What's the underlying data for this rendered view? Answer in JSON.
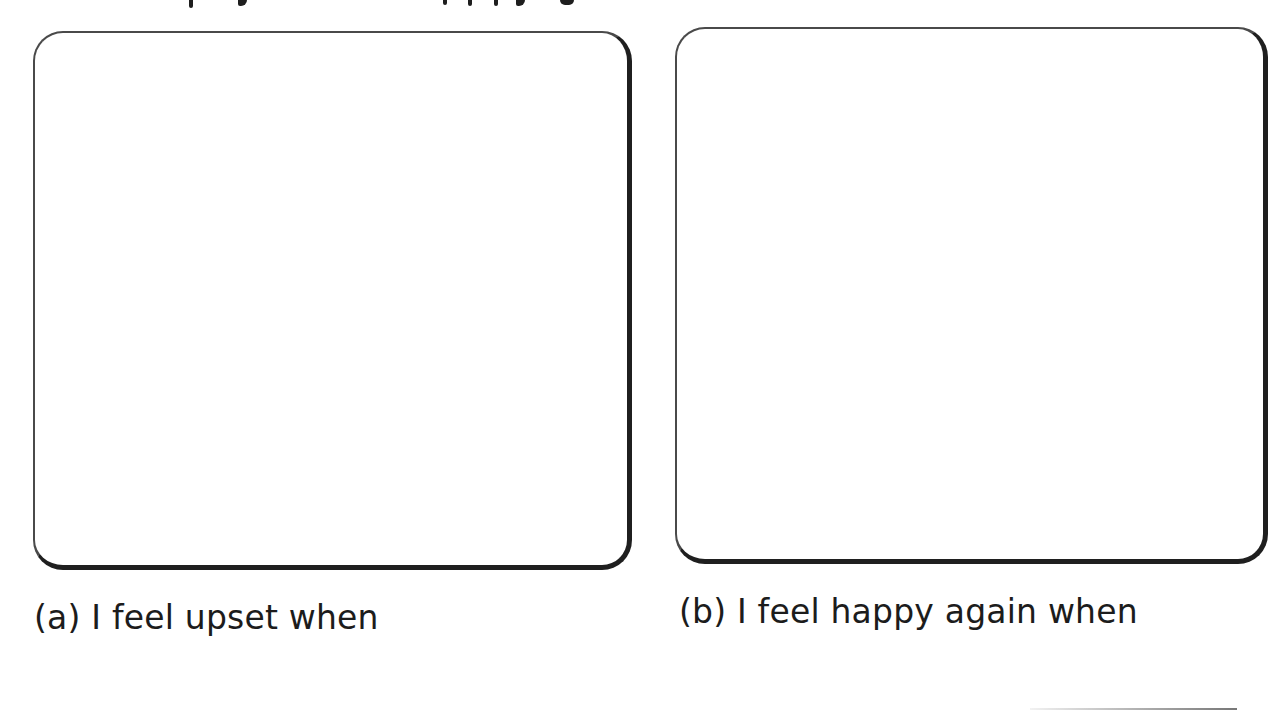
{
  "page": {
    "top_text_cropped": true
  },
  "panels": [
    {
      "id": "a",
      "prompt": "(a) I feel upset when",
      "drawing_area": "empty"
    },
    {
      "id": "b",
      "prompt": "(b) I feel happy again when",
      "drawing_area": "empty"
    }
  ],
  "colors": {
    "frame_border": "#1f1f1f",
    "frame_border_light": "#4a4a4a",
    "text": "#1c1c1c",
    "background": "#ffffff"
  }
}
